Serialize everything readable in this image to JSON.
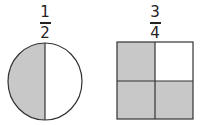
{
  "figures": [
    {
      "shape": "circle",
      "fraction": {
        "numerator": "1",
        "denominator": "2"
      },
      "parts": 2,
      "shaded_parts": 1
    },
    {
      "shape": "square",
      "fraction": {
        "numerator": "3",
        "denominator": "4"
      },
      "parts": 4,
      "shaded_parts": 3
    }
  ],
  "colors": {
    "shade": "#c8c8c8",
    "stroke": "#333333",
    "background": "#ffffff"
  }
}
